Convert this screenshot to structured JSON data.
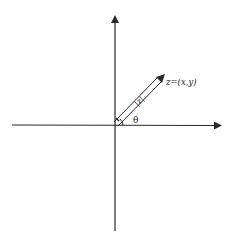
{
  "diagram": {
    "type": "complex-plane-polar-form",
    "axes": {
      "horizontal": {
        "x1": 12,
        "x2": 222,
        "y": 125,
        "arrow": "right"
      },
      "vertical": {
        "x": 115,
        "y1": 231,
        "y2": 15,
        "arrow": "up"
      },
      "origin": [
        115,
        125
      ]
    },
    "vector": {
      "from": [
        115,
        125
      ],
      "to": [
        161,
        77
      ],
      "style": "double-line-arrow",
      "modulus_label": "|z|",
      "point_label": "z=(x,y)"
    },
    "angle": {
      "label": "θ",
      "radius": 8
    },
    "colors": {
      "axis": "#2a2a2a",
      "vector": "#2a2a2a",
      "text": "#222222"
    }
  }
}
